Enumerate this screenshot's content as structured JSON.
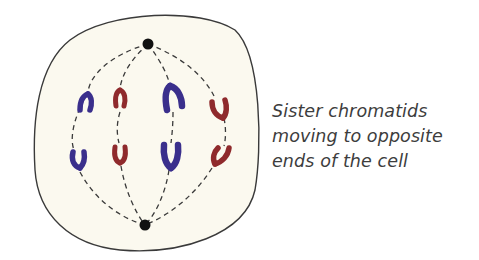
{
  "caption": {
    "lines": [
      "Sister chromatids",
      "moving to opposite",
      "ends of the cell"
    ]
  },
  "diagram": {
    "stage": "anaphase",
    "colors": {
      "cell_fill": "#fbf9ef",
      "cell_outline": "#3a3a3a",
      "spindle": "#3a3a3a",
      "pole": "#111111",
      "chromatid_blue": "#3a2f8c",
      "chromatid_red": "#8f2a2c"
    },
    "poles": [
      {
        "name": "top",
        "x": 148,
        "y": 44
      },
      {
        "name": "bottom",
        "x": 145,
        "y": 225
      }
    ],
    "chromatids": [
      {
        "color": "blue",
        "x": 85,
        "y": 102,
        "direction": "up"
      },
      {
        "color": "blue",
        "x": 75,
        "y": 158,
        "direction": "down"
      },
      {
        "color": "red",
        "x": 120,
        "y": 100,
        "direction": "up"
      },
      {
        "color": "red",
        "x": 120,
        "y": 153,
        "direction": "down"
      },
      {
        "color": "blue",
        "x": 175,
        "y": 99,
        "direction": "up"
      },
      {
        "color": "blue",
        "x": 171,
        "y": 155,
        "direction": "down"
      },
      {
        "color": "red",
        "x": 218,
        "y": 108,
        "direction": "up"
      },
      {
        "color": "red",
        "x": 218,
        "y": 156,
        "direction": "down"
      }
    ]
  }
}
